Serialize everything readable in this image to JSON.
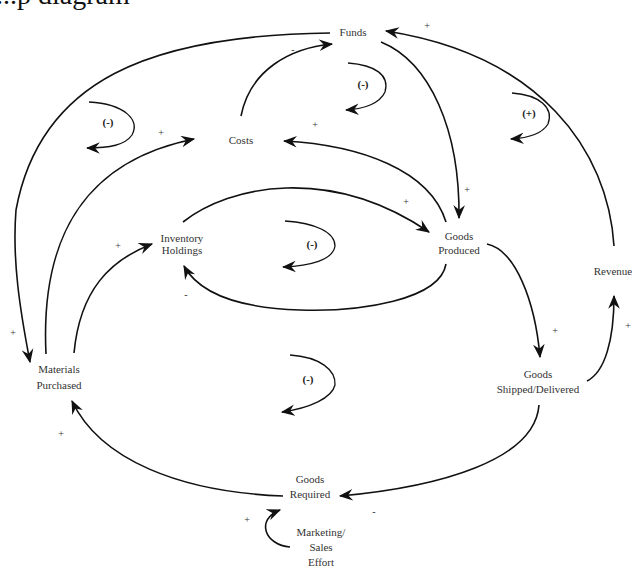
{
  "title_fragment": "...p diagram",
  "nodes": {
    "funds": {
      "label": "Funds"
    },
    "costs": {
      "label": "Costs"
    },
    "inventory": {
      "line1": "Inventory",
      "line2": "Holdings"
    },
    "goods_produced": {
      "line1": "Goods",
      "line2": "Produced"
    },
    "revenue": {
      "label": "Revenue"
    },
    "materials": {
      "line1": "Materials",
      "line2": "Purchased"
    },
    "goods_shipped": {
      "line1": "Goods",
      "line2": "Shipped/Delivered"
    },
    "goods_required": {
      "line1": "Goods",
      "line2": "Required"
    },
    "marketing": {
      "line1": "Marketing/",
      "line2": "Sales",
      "line3": "Effort"
    }
  },
  "edges": [
    {
      "from": "Revenue",
      "to": "Funds",
      "sign": "+"
    },
    {
      "from": "Costs",
      "to": "Funds",
      "sign": "-"
    },
    {
      "from": "Funds",
      "to": "Goods Produced",
      "sign": "+"
    },
    {
      "from": "Funds",
      "to": "Materials Purchased",
      "sign": "+"
    },
    {
      "from": "Goods Produced",
      "to": "Costs",
      "sign": "+"
    },
    {
      "from": "Materials Purchased",
      "to": "Costs",
      "sign": "+"
    },
    {
      "from": "Inventory Holdings",
      "to": "Goods Produced",
      "sign": "+"
    },
    {
      "from": "Goods Produced",
      "to": "Inventory Holdings",
      "sign": "-"
    },
    {
      "from": "Materials Purchased",
      "to": "Inventory Holdings",
      "sign": "+"
    },
    {
      "from": "Goods Produced",
      "to": "Goods Shipped/Delivered",
      "sign": "+"
    },
    {
      "from": "Goods Shipped/Delivered",
      "to": "Revenue",
      "sign": "+"
    },
    {
      "from": "Goods Shipped/Delivered",
      "to": "Goods Required",
      "sign": "-"
    },
    {
      "from": "Goods Required",
      "to": "Materials Purchased",
      "sign": "+"
    },
    {
      "from": "Marketing/Sales Effort",
      "to": "Goods Required",
      "sign": "+"
    }
  ],
  "signs": {
    "revenue_funds": "+",
    "costs_funds": "-",
    "funds_goods": "+",
    "funds_materials": "+",
    "goods_costs": "+",
    "materials_costs": "+",
    "inventory_goods": "+",
    "goods_inventory": "-",
    "materials_inventory": "+",
    "goods_shipped": "+",
    "shipped_revenue": "+",
    "shipped_required": "-",
    "required_materials": "+",
    "marketing_required": "+"
  },
  "loops": {
    "top_left": "(-)",
    "top_center": "(-)",
    "top_right": "(+)",
    "center": "(-)",
    "bottom": "(-)"
  }
}
